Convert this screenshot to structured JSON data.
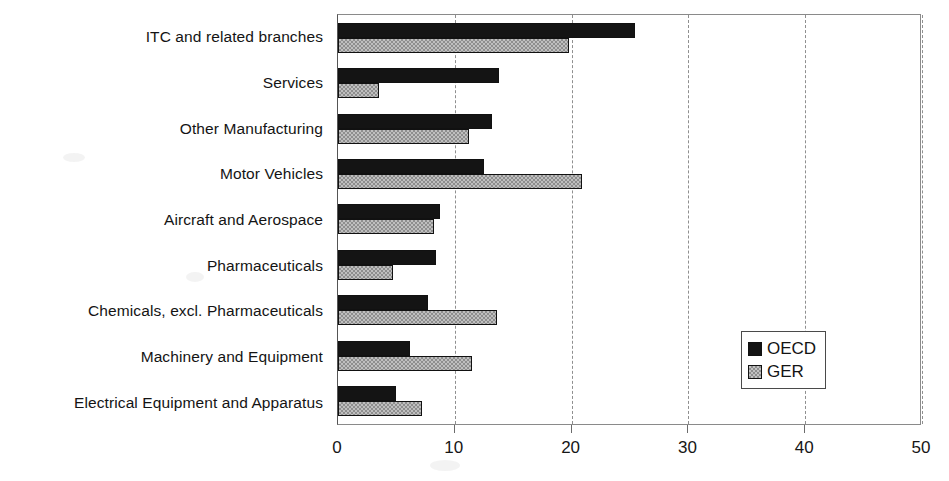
{
  "chart_data": {
    "type": "bar",
    "orientation": "horizontal",
    "title": "",
    "xlabel": "",
    "ylabel": "",
    "xlim": [
      0,
      50
    ],
    "xticks": [
      0,
      10,
      20,
      30,
      40,
      50
    ],
    "xtick_labels": [
      "0",
      "10",
      "20",
      "30",
      "40",
      "50"
    ],
    "grid": "vertical-dashed",
    "legend_position": "inside-right",
    "categories": [
      "ITC and related branches",
      "Services",
      "Other Manufacturing",
      "Motor Vehicles",
      "Aircraft and Aerospace",
      "Pharmaceuticals",
      "Chemicals, excl. Pharmaceuticals",
      "Machinery and Equipment",
      "Electrical Equipment and Apparatus"
    ],
    "series": [
      {
        "name": "OECD",
        "color": "#141414",
        "values": [
          25.4,
          13.8,
          13.2,
          12.5,
          8.7,
          8.4,
          7.7,
          6.2,
          5.0
        ]
      },
      {
        "name": "GER",
        "color": "#bfbfbf",
        "values": [
          19.8,
          3.5,
          11.2,
          20.9,
          8.2,
          4.7,
          13.6,
          11.5,
          7.2
        ]
      }
    ]
  },
  "legend": {
    "entries": [
      {
        "label": "OECD",
        "swatch": "solid-black-swatch"
      },
      {
        "label": "GER",
        "swatch": "checkered-gray-swatch"
      }
    ]
  },
  "colors": {
    "series_oecd": "#141414",
    "series_ger": "#bfbfbf",
    "axis": "#6b6b6b",
    "gridline": "#8f8f8f",
    "background": "#ffffff"
  }
}
